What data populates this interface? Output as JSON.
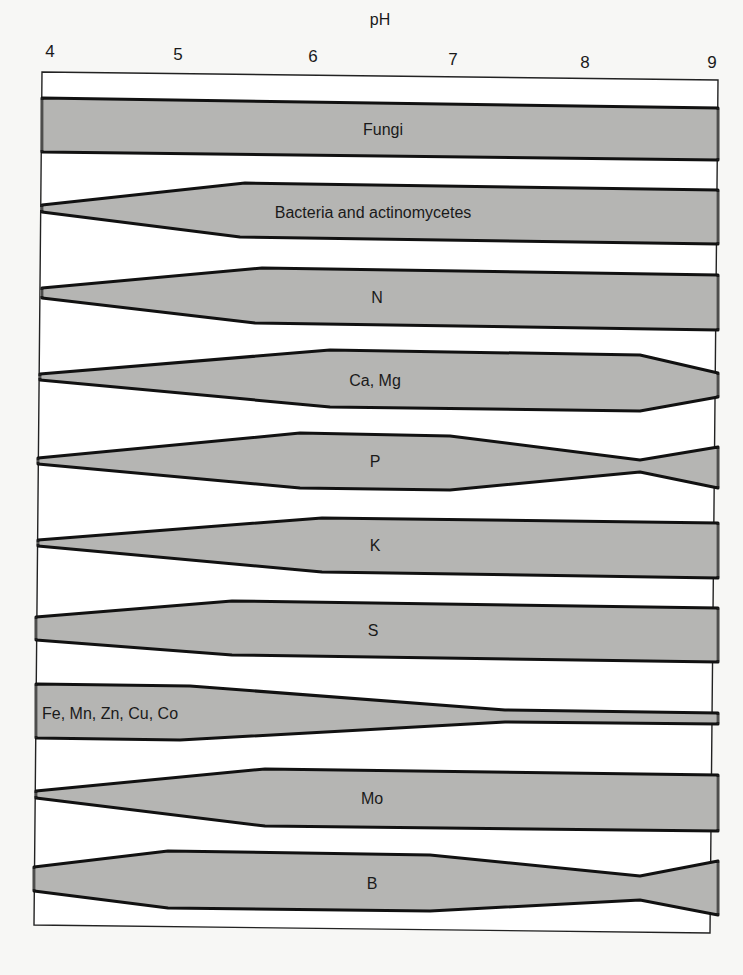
{
  "figure": {
    "axis_title": "pH",
    "axis_title_pos": [
      380,
      20
    ],
    "ticks": [
      {
        "label": "4",
        "x": 50,
        "y": 52
      },
      {
        "label": "5",
        "x": 178,
        "y": 55
      },
      {
        "label": "6",
        "x": 313,
        "y": 57
      },
      {
        "label": "7",
        "x": 453,
        "y": 60
      },
      {
        "label": "8",
        "x": 585,
        "y": 63
      },
      {
        "label": "9",
        "x": 712,
        "y": 63
      }
    ],
    "colors": {
      "band_fill": "#b5b5b3",
      "band_stroke": "#111111",
      "frame_stroke": "#222222",
      "background": "#f7f7f5"
    },
    "frame": [
      [
        42,
        72
      ],
      [
        718,
        80
      ],
      [
        710,
        933
      ],
      [
        34,
        925
      ]
    ],
    "bands": [
      {
        "label": "Fungi",
        "label_pos": [
          383,
          130
        ],
        "align": "center",
        "points": [
          [
            42,
            98
          ],
          [
            718,
            108
          ],
          [
            718,
            160
          ],
          [
            42,
            152
          ]
        ]
      },
      {
        "label": "Bacteria and actinomycetes",
        "label_pos": [
          373,
          213
        ],
        "align": "center",
        "points": [
          [
            42,
            205
          ],
          [
            245,
            183
          ],
          [
            718,
            190
          ],
          [
            718,
            244
          ],
          [
            240,
            237
          ],
          [
            42,
            212
          ]
        ]
      },
      {
        "label": "N",
        "label_pos": [
          377,
          298
        ],
        "align": "center",
        "points": [
          [
            42,
            288
          ],
          [
            262,
            268
          ],
          [
            718,
            275
          ],
          [
            718,
            330
          ],
          [
            255,
            323
          ],
          [
            42,
            298
          ]
        ]
      },
      {
        "label": "Ca, Mg",
        "label_pos": [
          375,
          381
        ],
        "align": "center",
        "points": [
          [
            40,
            374
          ],
          [
            330,
            350
          ],
          [
            640,
            355
          ],
          [
            718,
            373
          ],
          [
            718,
            397
          ],
          [
            640,
            411
          ],
          [
            330,
            407
          ],
          [
            40,
            380
          ]
        ]
      },
      {
        "label": "P",
        "label_pos": [
          375,
          462
        ],
        "align": "center",
        "points": [
          [
            38,
            458
          ],
          [
            300,
            433
          ],
          [
            450,
            436
          ],
          [
            640,
            460
          ],
          [
            718,
            447
          ],
          [
            718,
            488
          ],
          [
            640,
            472
          ],
          [
            450,
            490
          ],
          [
            300,
            488
          ],
          [
            38,
            464
          ]
        ]
      },
      {
        "label": "K",
        "label_pos": [
          375,
          546
        ],
        "align": "center",
        "points": [
          [
            38,
            540
          ],
          [
            322,
            518
          ],
          [
            718,
            523
          ],
          [
            718,
            578
          ],
          [
            322,
            572
          ],
          [
            38,
            546
          ]
        ]
      },
      {
        "label": "S",
        "label_pos": [
          373,
          631
        ],
        "align": "center",
        "points": [
          [
            36,
            617
          ],
          [
            232,
            601
          ],
          [
            718,
            608
          ],
          [
            718,
            662
          ],
          [
            232,
            655
          ],
          [
            36,
            640
          ]
        ]
      },
      {
        "label": "Fe, Mn, Zn, Cu, Co",
        "label_pos": [
          42,
          714
        ],
        "align": "left",
        "points": [
          [
            36,
            684
          ],
          [
            190,
            686
          ],
          [
            505,
            710
          ],
          [
            718,
            713
          ],
          [
            718,
            724
          ],
          [
            505,
            722
          ],
          [
            180,
            740
          ],
          [
            36,
            738
          ]
        ]
      },
      {
        "label": "Mo",
        "label_pos": [
          372,
          799
        ],
        "align": "center",
        "points": [
          [
            36,
            791
          ],
          [
            265,
            769
          ],
          [
            718,
            775
          ],
          [
            718,
            831
          ],
          [
            265,
            826
          ],
          [
            36,
            798
          ]
        ]
      },
      {
        "label": "B",
        "label_pos": [
          372,
          884
        ],
        "align": "center",
        "points": [
          [
            34,
            867
          ],
          [
            168,
            851
          ],
          [
            430,
            855
          ],
          [
            640,
            876
          ],
          [
            718,
            861
          ],
          [
            718,
            915
          ],
          [
            640,
            900
          ],
          [
            430,
            911
          ],
          [
            168,
            908
          ],
          [
            34,
            891
          ]
        ]
      }
    ]
  }
}
